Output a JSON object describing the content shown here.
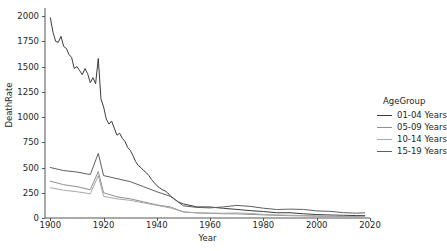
{
  "chart_data": {
    "type": "line",
    "title": "",
    "xlabel": "Year",
    "ylabel": "DeathRate",
    "xlim": [
      1898,
      2020
    ],
    "ylim": [
      0,
      2080
    ],
    "xticks": [
      1900,
      1920,
      1940,
      1960,
      1980,
      2000,
      2020
    ],
    "yticks": [
      0,
      250,
      500,
      750,
      1000,
      1250,
      1500,
      1750,
      2000
    ],
    "grid": false,
    "legend_position": "right",
    "legend_title": "AgeGroup",
    "series": [
      {
        "name": "01-04 Years",
        "color": "#3b3b3b",
        "x": [
          1900,
          1901,
          1902,
          1903,
          1904,
          1905,
          1906,
          1907,
          1908,
          1909,
          1910,
          1911,
          1912,
          1913,
          1914,
          1915,
          1916,
          1917,
          1918,
          1919,
          1920,
          1921,
          1922,
          1923,
          1924,
          1925,
          1926,
          1927,
          1928,
          1929,
          1930,
          1931,
          1932,
          1933,
          1934,
          1935,
          1936,
          1937,
          1938,
          1939,
          1940,
          1941,
          1942,
          1943,
          1944,
          1945,
          1946,
          1947,
          1948,
          1949,
          1950,
          1955,
          1960,
          1965,
          1970,
          1975,
          1980,
          1985,
          1990,
          1995,
          2000,
          2005,
          2010,
          2015,
          2018
        ],
        "y": [
          1983,
          1840,
          1750,
          1740,
          1800,
          1700,
          1680,
          1620,
          1590,
          1480,
          1500,
          1460,
          1420,
          1480,
          1430,
          1340,
          1390,
          1330,
          1580,
          1180,
          1100,
          980,
          930,
          960,
          890,
          820,
          840,
          790,
          760,
          700,
          670,
          620,
          560,
          520,
          500,
          470,
          450,
          420,
          380,
          350,
          320,
          300,
          280,
          270,
          250,
          220,
          200,
          180,
          160,
          150,
          139,
          110,
          109,
          96,
          85,
          73,
          64,
          52,
          52,
          42,
          34,
          30,
          27,
          24,
          23
        ]
      },
      {
        "name": "05-09 Years",
        "color": "#8f8f8f",
        "x": [
          1900,
          1905,
          1910,
          1915,
          1918,
          1920,
          1925,
          1930,
          1935,
          1940,
          1945,
          1950,
          1955,
          1960,
          1965,
          1970,
          1975,
          1980,
          1985,
          1990,
          1995,
          2000,
          2005,
          2010,
          2015,
          2018
        ],
        "y": [
          365,
          330,
          310,
          280,
          460,
          250,
          210,
          190,
          160,
          130,
          110,
          60,
          50,
          46,
          42,
          41,
          36,
          31,
          26,
          23,
          21,
          18,
          17,
          14,
          13,
          13
        ]
      },
      {
        "name": "10-14 Years",
        "color": "#a8a8a8",
        "x": [
          1900,
          1905,
          1910,
          1915,
          1918,
          1920,
          1925,
          1930,
          1935,
          1940,
          1945,
          1950,
          1955,
          1960,
          1965,
          1970,
          1975,
          1980,
          1985,
          1990,
          1995,
          2000,
          2005,
          2010,
          2015,
          2018
        ],
        "y": [
          300,
          275,
          260,
          240,
          420,
          215,
          190,
          175,
          150,
          125,
          100,
          60,
          52,
          49,
          47,
          50,
          45,
          36,
          31,
          27,
          25,
          21,
          18,
          16,
          15,
          15
        ]
      },
      {
        "name": "15-19 Years",
        "color": "#5f5f5f",
        "x": [
          1900,
          1905,
          1910,
          1915,
          1918,
          1920,
          1925,
          1930,
          1935,
          1940,
          1945,
          1950,
          1955,
          1960,
          1965,
          1970,
          1975,
          1980,
          1985,
          1990,
          1995,
          2000,
          2005,
          2010,
          2015,
          2018
        ],
        "y": [
          500,
          470,
          455,
          430,
          640,
          420,
          390,
          360,
          310,
          260,
          215,
          120,
          105,
          100,
          110,
          125,
          115,
          97,
          84,
          88,
          85,
          70,
          66,
          53,
          48,
          51
        ]
      }
    ]
  },
  "legend": {
    "title": "AgeGroup",
    "items": [
      {
        "label": "01-04 Years"
      },
      {
        "label": "05-09 Years"
      },
      {
        "label": "10-14 Years"
      },
      {
        "label": "15-19 Years"
      }
    ]
  },
  "axes": {
    "xlabel": "Year",
    "ylabel": "DeathRate",
    "xtick_labels": [
      "1900",
      "1920",
      "1940",
      "1960",
      "1980",
      "2000",
      "2020"
    ],
    "ytick_labels": [
      "0",
      "250",
      "500",
      "750",
      "1000",
      "1250",
      "1500",
      "1750",
      "2000"
    ]
  }
}
